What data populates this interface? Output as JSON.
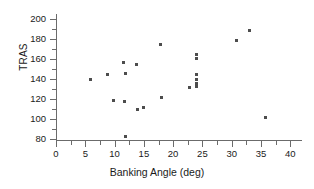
{
  "chart_data": {
    "type": "scatter",
    "title": "",
    "xlabel": "Banking Angle (deg)",
    "ylabel": "TRAS",
    "xlim": [
      0,
      42
    ],
    "ylim": [
      78,
      205
    ],
    "xticks": [
      0,
      5,
      10,
      15,
      20,
      25,
      30,
      35,
      40
    ],
    "yticks": [
      80,
      100,
      120,
      140,
      160,
      180,
      200
    ],
    "xminor_step": 2.5,
    "yminor_step": 10,
    "grid": false,
    "legend": null,
    "marker": {
      "shape": "square",
      "color": "#4d4d4d",
      "size": 3
    },
    "points": [
      {
        "x": 5.8,
        "y": 140
      },
      {
        "x": 8.7,
        "y": 145
      },
      {
        "x": 9.8,
        "y": 119
      },
      {
        "x": 11.5,
        "y": 157
      },
      {
        "x": 11.7,
        "y": 118
      },
      {
        "x": 11.8,
        "y": 146
      },
      {
        "x": 11.8,
        "y": 83
      },
      {
        "x": 13.7,
        "y": 155
      },
      {
        "x": 13.9,
        "y": 110
      },
      {
        "x": 14.9,
        "y": 112
      },
      {
        "x": 17.8,
        "y": 175
      },
      {
        "x": 18.0,
        "y": 122
      },
      {
        "x": 22.8,
        "y": 132
      },
      {
        "x": 23.9,
        "y": 165
      },
      {
        "x": 23.9,
        "y": 161
      },
      {
        "x": 23.9,
        "y": 145
      },
      {
        "x": 23.9,
        "y": 140
      },
      {
        "x": 23.9,
        "y": 136
      },
      {
        "x": 24.0,
        "y": 133
      },
      {
        "x": 30.8,
        "y": 179
      },
      {
        "x": 33.0,
        "y": 189
      },
      {
        "x": 35.8,
        "y": 102
      }
    ]
  }
}
